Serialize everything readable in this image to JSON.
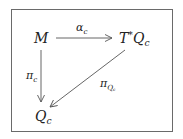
{
  "diagram": {
    "type": "commutative-diagram",
    "nodes": {
      "M": {
        "base": "M",
        "sup": "",
        "sub": ""
      },
      "cotangent": {
        "base": "T",
        "sup": "*",
        "base2": "Q",
        "sub": "c"
      },
      "Q": {
        "base": "Q",
        "sub": "c"
      }
    },
    "edges": {
      "alpha": {
        "from": "M",
        "to": "T*Q_c",
        "base": "α",
        "sub": "c"
      },
      "pi": {
        "from": "M",
        "to": "Q_c",
        "base": "π",
        "sub": "c"
      },
      "piQ": {
        "from": "T*Q_c",
        "to": "Q_c",
        "base": "π",
        "sub": "Q",
        "subsub": "c"
      }
    },
    "colors": {
      "line": "#555555",
      "text": "#222222",
      "border": "#6a6a6a"
    }
  }
}
